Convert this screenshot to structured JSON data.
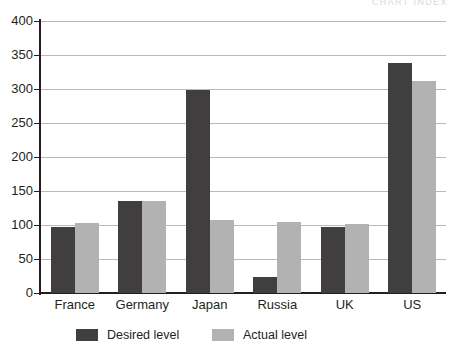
{
  "running_head": "CHART INDEX",
  "chart_data": {
    "type": "bar",
    "title": "",
    "subtitle": "",
    "xlabel": "",
    "ylabel": "",
    "ylim": [
      0,
      400
    ],
    "ytick_step": 50,
    "ytick_labels": [
      "0",
      "50",
      "100",
      "150",
      "200",
      "250",
      "300",
      "350",
      "400"
    ],
    "ytick_values": [
      0,
      50,
      100,
      150,
      200,
      250,
      300,
      350,
      400
    ],
    "grid": true,
    "grid_axis": "y",
    "legend_position": "bottom",
    "categories": [
      "France",
      "Germany",
      "Japan",
      "Russia",
      "UK",
      "US"
    ],
    "series": [
      {
        "name": "Desired level",
        "color": "#403e3e",
        "values": [
          97,
          135,
          298,
          23,
          97,
          338
        ]
      },
      {
        "name": "Actual level",
        "color": "#b2b2b2",
        "values": [
          103,
          135,
          107,
          105,
          102,
          312
        ]
      }
    ],
    "colors": {
      "desired": "#403e3e",
      "actual": "#b2b2b2",
      "axis": "#231f20",
      "gridline": "#b9b9bd",
      "background": "#ffffff"
    }
  },
  "legend": {
    "items": [
      {
        "label": "Desired level",
        "swatch": "desired"
      },
      {
        "label": "Actual level",
        "swatch": "actual"
      }
    ]
  }
}
